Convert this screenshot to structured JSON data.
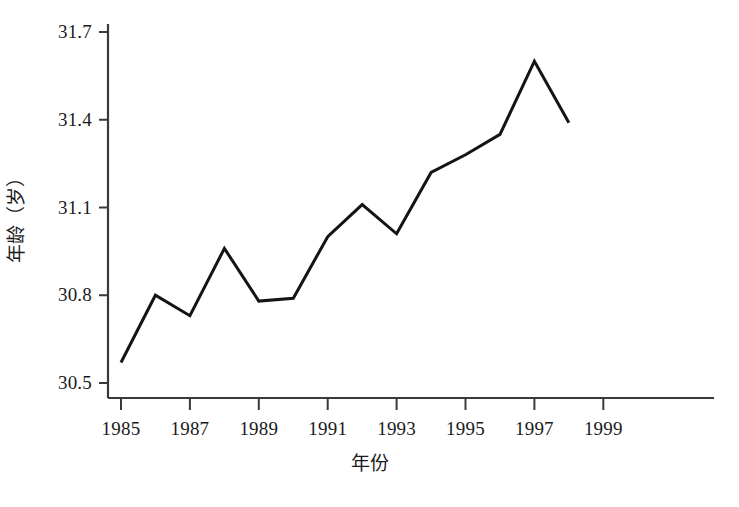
{
  "chart_data": {
    "type": "line",
    "title": "",
    "xlabel": "年份",
    "ylabel": "年龄（岁）",
    "x": [
      1985,
      1986,
      1987,
      1988,
      1989,
      1990,
      1991,
      1992,
      1993,
      1994,
      1995,
      1996,
      1997,
      1998
    ],
    "values": [
      30.57,
      30.8,
      30.73,
      30.96,
      30.78,
      30.79,
      31.0,
      31.11,
      31.01,
      31.22,
      31.28,
      31.35,
      31.6,
      31.39
    ],
    "series": [
      {
        "name": "年龄",
        "values": [
          30.57,
          30.8,
          30.73,
          30.96,
          30.78,
          30.79,
          31.0,
          31.11,
          31.01,
          31.22,
          31.28,
          31.35,
          31.6,
          31.39
        ]
      }
    ],
    "xlim": [
      1985,
      1999.5
    ],
    "ylim": [
      30.5,
      31.7
    ],
    "y_ticks": [
      30.5,
      30.8,
      31.1,
      31.4,
      31.7
    ],
    "y_tick_labels": [
      "30.5",
      "30.8",
      "31.1",
      "31.4",
      "31.7"
    ],
    "x_ticks": [
      1985,
      1987,
      1989,
      1991,
      1993,
      1995,
      1997,
      1999
    ],
    "x_tick_labels": [
      "1985",
      "1987",
      "1989",
      "1991",
      "1993",
      "1995",
      "1997",
      "1999"
    ],
    "grid": false,
    "legend": false,
    "line_color": "#141414",
    "line_width": 3,
    "axis_color": "#3a3a3a",
    "background": "#ffffff"
  }
}
